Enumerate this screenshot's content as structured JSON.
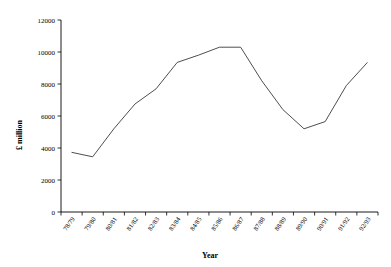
{
  "chart_data": {
    "type": "line",
    "title": "",
    "xlabel": "Year",
    "ylabel": "£ million",
    "grid": false,
    "legend": "none",
    "ylim": [
      0,
      12000
    ],
    "ytick_labels": [
      "0",
      "2000",
      "4000",
      "6000",
      "8000",
      "10000",
      "12000"
    ],
    "yticks": [
      0,
      2000,
      4000,
      6000,
      8000,
      10000,
      12000
    ],
    "categories": [
      "78/79",
      "79/80",
      "80/81",
      "81/82",
      "82/83",
      "83/84",
      "84/85",
      "85/86",
      "86/87",
      "87/88",
      "88/89",
      "89/90",
      "90/91",
      "91/92",
      "92/93"
    ],
    "series": [
      {
        "name": "£ million",
        "color": "#3a3a3a",
        "values": [
          3730,
          3450,
          5200,
          6750,
          7700,
          9350,
          9800,
          10300,
          10300,
          8200,
          6400,
          5200,
          5650,
          7900,
          9350
        ]
      }
    ]
  }
}
